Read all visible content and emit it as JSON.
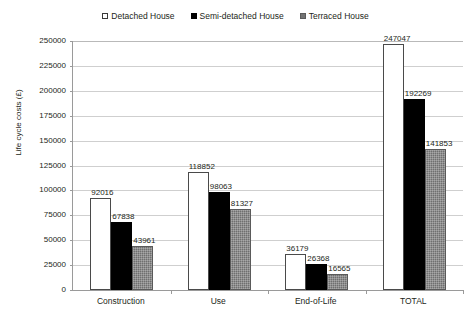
{
  "chart_data": {
    "type": "bar",
    "title": "",
    "xlabel": "",
    "ylabel": "Life cycle costs (£)",
    "ylim": [
      0,
      250000
    ],
    "ytick_step": 25000,
    "grid": true,
    "legend_position": "top-center",
    "categories": [
      "Construction",
      "Use",
      "End-of-Life",
      "TOTAL"
    ],
    "ytick_labels": [
      "250000",
      "225000",
      "200000",
      "175000",
      "150000",
      "125000",
      "100000",
      "75000",
      "50000",
      "25000",
      "0"
    ],
    "ytick_values": [
      250000,
      225000,
      200000,
      175000,
      150000,
      125000,
      100000,
      75000,
      50000,
      25000,
      0
    ],
    "series": [
      {
        "name": "Detached House",
        "color": "#ffffff",
        "marker": "open-square",
        "values": [
          92016,
          118852,
          36179,
          247047
        ],
        "labels": [
          "92016",
          "118852",
          "36179",
          "247047"
        ]
      },
      {
        "name": "Semi-detached House",
        "color": "#000000",
        "marker": "filled-square",
        "values": [
          67838,
          98063,
          26368,
          192269
        ],
        "labels": [
          "67838",
          "98063",
          "26368",
          "192269"
        ]
      },
      {
        "name": "Terraced House",
        "color": "#6f6f6f",
        "marker": "hatched-square",
        "values": [
          43961,
          81327,
          16565,
          141853
        ],
        "labels": [
          "43961",
          "81327",
          "16565",
          "141853"
        ]
      }
    ]
  },
  "legend": {
    "items": [
      {
        "label": "Detached House"
      },
      {
        "label": "Semi-detached House"
      },
      {
        "label": "Terraced House"
      }
    ]
  },
  "axis": {
    "y_title": "Life cycle costs (£)"
  }
}
